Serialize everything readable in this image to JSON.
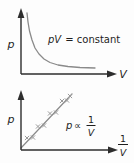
{
  "colors": {
    "background": "#fdfdfd",
    "axis": "#2d2d2d",
    "curve": "#8a8a8a",
    "marker": "#9a9a9a",
    "text": "#1e1e1e"
  },
  "top_graph": {
    "type": "curve",
    "y_axis_label": "p",
    "x_axis_label": "V",
    "equation_variables": "pV",
    "equation_rest": "= constant",
    "curve_shape": "rectangular-hyperbola",
    "curve_points": [
      [
        27,
        13
      ],
      [
        28,
        22
      ],
      [
        29.5,
        31
      ],
      [
        32,
        40
      ],
      [
        35,
        48
      ],
      [
        39,
        54
      ],
      [
        44,
        59
      ],
      [
        50,
        62.5
      ],
      [
        58,
        65
      ],
      [
        68,
        66.5
      ],
      [
        80,
        67.5
      ],
      [
        95,
        68
      ]
    ]
  },
  "bottom_graph": {
    "type": "scatter-with-fit-line",
    "y_axis_label": "p",
    "x_axis_label_numerator": "1",
    "x_axis_label_denominator": "V",
    "relation_variable": "p",
    "relation_symbol": "∝",
    "relation_numerator": "1",
    "relation_denominator": "V",
    "marker_glyph": "×",
    "fit_line": {
      "x1": 21,
      "y1": 148,
      "x2": 72,
      "y2": 94
    },
    "markers": [
      [
        27,
        138
      ],
      [
        33,
        137.5
      ],
      [
        38,
        126.5
      ],
      [
        44,
        125.5
      ],
      [
        50,
        113.5
      ],
      [
        56,
        112.5
      ],
      [
        62,
        101
      ],
      [
        67,
        100.5
      ],
      [
        70,
        96
      ]
    ]
  }
}
